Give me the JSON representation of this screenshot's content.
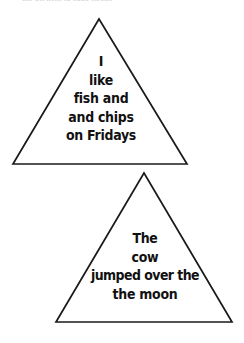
{
  "page": {
    "background_color": "#ffffff",
    "stroke_color": "#1a1a1a",
    "text_color": "#111111",
    "cut_off_header": "the bit next to each stroke"
  },
  "shapes": [
    {
      "name": "triangle-one",
      "apex": {
        "x": 99,
        "y": 19
      },
      "base_left": {
        "x": 13,
        "y": 164
      },
      "base_right": {
        "x": 187,
        "y": 164
      },
      "lines": [
        "I",
        "like",
        "fish and",
        "and chips",
        "on Fridays"
      ]
    },
    {
      "name": "triangle-two",
      "apex": {
        "x": 144,
        "y": 173
      },
      "base_left": {
        "x": 56,
        "y": 322
      },
      "base_right": {
        "x": 232,
        "y": 322
      },
      "lines": [
        "The",
        "cow",
        "jumped over the",
        "the moon"
      ]
    }
  ],
  "triangle_one": {
    "line_1": "I",
    "line_2": "like",
    "line_3": "fish and",
    "line_4": "and chips",
    "line_5": "on Fridays"
  },
  "triangle_two": {
    "line_1": "The",
    "line_2": "cow",
    "line_3": "jumped over the",
    "line_4": "the moon"
  }
}
